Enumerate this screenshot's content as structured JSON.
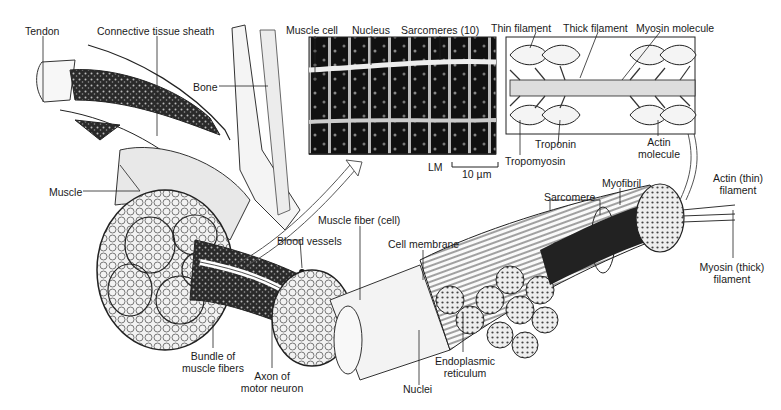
{
  "figure": {
    "labels": {
      "tendon": "Tendon",
      "connective_tissue_sheath": "Connective tissue sheath",
      "bone": "Bone",
      "muscle": "Muscle",
      "muscle_cell": "Muscle cell",
      "nucleus": "Nucleus",
      "sarcomeres": "Sarcomeres (10)",
      "thin_filament": "Thin filament",
      "thick_filament": "Thick filament",
      "myosin_molecule": "Myosin molecule",
      "troponin": "Troponin",
      "tropomyosin": "Tropomyosin",
      "actin_molecule_1": "Actin",
      "actin_molecule_2": "molecule",
      "lm": "LM",
      "scale_bar": "10 µm",
      "actin_thin_filament_1": "Actin (thin)",
      "actin_thin_filament_2": "filament",
      "myofibril": "Myofibril",
      "sarcomere": "Sarcomere",
      "muscle_fiber": "Muscle fiber (cell)",
      "blood_vessels": "Blood vessels",
      "cell_membrane": "Cell membrane",
      "bundle_1": "Bundle of",
      "bundle_2": "muscle fibers",
      "axon_1": "Axon of",
      "axon_2": "motor neuron",
      "nuclei": "Nuclei",
      "er_1": "Endoplasmic",
      "er_2": "reticulum",
      "myosin_thick_1": "Myosin (thick)",
      "myosin_thick_2": "filament"
    }
  },
  "colors": {
    "ink": "#1a1a1a",
    "dark": "#111111",
    "mid": "#8a8a8a",
    "light": "#d8d8d8",
    "paper": "#ffffff"
  }
}
